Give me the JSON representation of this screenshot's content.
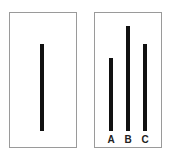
{
  "diagram": {
    "reference_card": {
      "line": {
        "top": 44,
        "bottom": 131,
        "x": 40
      }
    },
    "comparison_card": {
      "lines": [
        {
          "label": "A",
          "top": 58,
          "bottom": 131,
          "x": 109
        },
        {
          "label": "B",
          "top": 26,
          "bottom": 131,
          "x": 126
        },
        {
          "label": "C",
          "top": 44,
          "bottom": 131,
          "x": 143
        }
      ]
    },
    "colors": {
      "line": "#111111",
      "border": "#9a9a9a",
      "background": "#ffffff"
    }
  }
}
